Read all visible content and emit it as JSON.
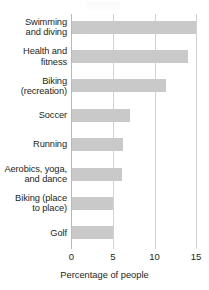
{
  "chart_data": {
    "type": "bar",
    "orientation": "horizontal",
    "title": "",
    "xlabel": "Percentage of people",
    "ylabel": "",
    "xlim": [
      0,
      15
    ],
    "xticks": [
      0,
      5,
      10,
      15
    ],
    "xtick_labels": [
      "0",
      "5",
      "10",
      "15"
    ],
    "grid": "vertical",
    "legend": "none",
    "bar_color": "#c9c9c9",
    "gridline_color": "#d3d3d3",
    "text_color": "#231f20",
    "categories": [
      "Swimming and diving",
      "Health and fitness",
      "Biking (recreation)",
      "Soccer",
      "Running",
      "Aerobics, yoga, and dance",
      "Biking (place to place)",
      "Golf"
    ],
    "category_lines": [
      [
        "Swimming",
        "and diving"
      ],
      [
        "Health and",
        "fitness"
      ],
      [
        "Biking",
        "(recreation)"
      ],
      [
        "Soccer"
      ],
      [
        "Running"
      ],
      [
        "Aerobics, yoga,",
        "and dance"
      ],
      [
        "Biking (place",
        "to place)"
      ],
      [
        "Golf"
      ]
    ],
    "values": [
      15.0,
      14.0,
      11.4,
      7.0,
      6.2,
      6.1,
      5.0,
      5.0
    ]
  }
}
